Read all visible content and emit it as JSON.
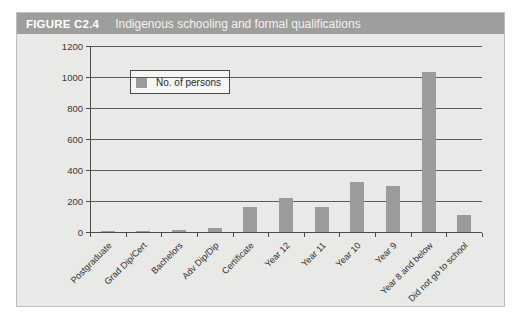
{
  "figure": {
    "number_label": "FIGURE C2.4",
    "title": "Indigenous schooling and formal qualifications",
    "header_bg": "#9e9e9c",
    "panel_bg": "#e9e9e7"
  },
  "legend": {
    "label": "No. of persons",
    "swatch_color": "#9b9b99",
    "position": "inside-top-left"
  },
  "chart_data": {
    "type": "bar",
    "title": "Indigenous schooling and formal qualifications",
    "xlabel": "",
    "ylabel": "",
    "ylim": [
      0,
      1200
    ],
    "ytick_step": 200,
    "yticks": [
      "0",
      "200",
      "400",
      "600",
      "800",
      "1000",
      "1200"
    ],
    "grid": true,
    "grid_axis": "y",
    "legend_position": "upper left",
    "series": [
      {
        "name": "No. of persons",
        "color": "#9b9b99",
        "values": [
          2,
          4,
          14,
          24,
          160,
          218,
          160,
          325,
          297,
          1035,
          112
        ]
      }
    ],
    "categories": [
      "Postgraduate",
      "Grad Dip/Cert",
      "Bachelors",
      "Adv Dip/Dip",
      "Certificate",
      "Year 12",
      "Year 11",
      "Year 10",
      "Year 9",
      "Year 8 and below",
      "Did not go to school"
    ]
  }
}
